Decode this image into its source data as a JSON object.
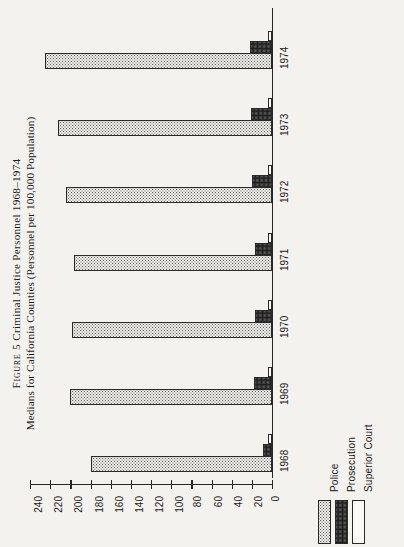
{
  "figure": {
    "label": "Figure 5",
    "title_line1": "FIGURE 5 Criminal Justice Personnel 1968–1974",
    "title_line1_caps": "Figure 5",
    "title_line1_rest": " Criminal Justice Personnel 1968–1974",
    "title_line2": "Medians for California Counties (Personnel per 100,000 Population)"
  },
  "legend": {
    "items": [
      {
        "label": "Police",
        "pattern": "light-dotted",
        "color": "#efeeea"
      },
      {
        "label": "Prosecution",
        "pattern": "dense-dotted",
        "color": "#c9c8c4"
      },
      {
        "label": "Superior Court",
        "pattern": "empty",
        "color": "#fbfaf7"
      }
    ]
  },
  "axis": {
    "tick_labels": [
      "240",
      "220",
      "200",
      "180",
      "160",
      "140",
      "120",
      "100",
      "80",
      "60",
      "40",
      "20",
      "0"
    ],
    "orientation": "horizontal-reversed"
  },
  "chart_data": {
    "type": "bar",
    "orientation": "horizontal",
    "title": "FIGURE 5 Criminal Justice Personnel 1968–1974",
    "subtitle": "Medians for California Counties (Personnel per 100,000 Population)",
    "xlabel": "Personnel per 100,000 Population",
    "ylabel": "",
    "xlim": [
      0,
      240
    ],
    "xticks": [
      0,
      20,
      40,
      60,
      80,
      100,
      120,
      140,
      160,
      180,
      200,
      220,
      240
    ],
    "x_axis_reversed": true,
    "grid": false,
    "legend_position": "bottom-right",
    "categories": [
      "1968",
      "1969",
      "1970",
      "1971",
      "1972",
      "1973",
      "1974"
    ],
    "series": [
      {
        "name": "Police",
        "values": [
          180,
          200,
          198,
          196,
          204,
          212,
          225
        ]
      },
      {
        "name": "Prosecution",
        "values": [
          9,
          18,
          17,
          17,
          20,
          21,
          22
        ]
      },
      {
        "name": "Superior Court",
        "values": [
          4,
          4,
          4,
          4,
          4,
          4,
          4
        ]
      }
    ]
  }
}
